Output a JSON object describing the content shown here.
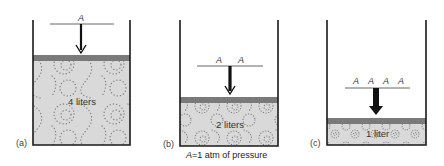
{
  "colors": {
    "wall": "#1a1a1a",
    "piston": "#7a7a7a",
    "gas_fill": "#d9d9d9",
    "gas_dots": "#7d7d7d",
    "arrow": "#111111"
  },
  "caption": "A=1 atm of pressure",
  "caption_parts": {
    "symbol": "A",
    "rest": "=1 atm of pressure"
  },
  "panels": [
    {
      "id": "a",
      "label": "(a)",
      "pressure_labels": [
        "A"
      ],
      "volume_label": "4 liters",
      "pressure_atm": 1,
      "volume_liters": 4
    },
    {
      "id": "b",
      "label": "(b)",
      "pressure_labels": [
        "A",
        "A"
      ],
      "volume_label": "2 liters",
      "pressure_atm": 2,
      "volume_liters": 2
    },
    {
      "id": "c",
      "label": "(c)",
      "pressure_labels": [
        "A",
        "A",
        "A",
        "A"
      ],
      "volume_label": "1 liter",
      "pressure_atm": 4,
      "volume_liters": 1
    }
  ]
}
